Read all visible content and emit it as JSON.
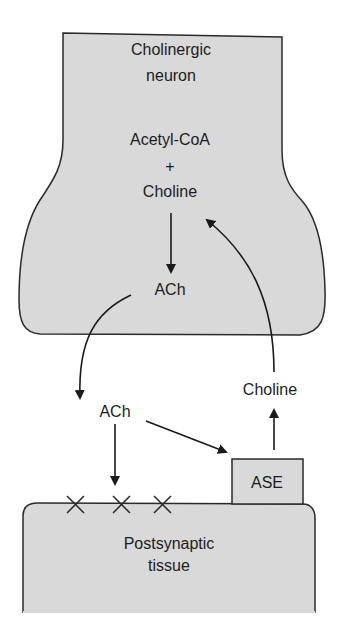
{
  "diagram": {
    "type": "cholinergic-synapse-pathway",
    "colors": {
      "tissue_fill": "#d9d9d9",
      "outline": "#2a2a2a",
      "background": "#ffffff",
      "text": "#1c1c1c"
    },
    "presynaptic": {
      "title_line1": "Cholinergic",
      "title_line2": "neuron",
      "substrate1": "Acetyl-CoA",
      "plus": "+",
      "substrate2": "Choline",
      "product": "ACh"
    },
    "synaptic_cleft": {
      "released": "ACh",
      "recycled": "Choline"
    },
    "enzyme": {
      "label": "ASE"
    },
    "postsynaptic": {
      "line1": "Postsynaptic",
      "line2": "tissue",
      "receptor_marks": [
        "×",
        "×",
        "×"
      ]
    },
    "edges": [
      {
        "from": "Acetyl-CoA + Choline",
        "to": "ACh (neuron)"
      },
      {
        "from": "ACh (neuron)",
        "to": "ACh (cleft)"
      },
      {
        "from": "ACh (cleft)",
        "to": "Postsynaptic receptors"
      },
      {
        "from": "ACh (cleft)",
        "to": "ASE"
      },
      {
        "from": "ASE",
        "to": "Choline (cleft)"
      },
      {
        "from": "Choline (cleft)",
        "to": "Choline (neuron)"
      }
    ]
  }
}
